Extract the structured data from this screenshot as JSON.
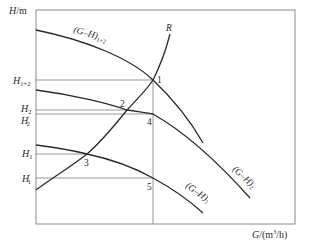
{
  "diagram": {
    "type": "pump-curve",
    "y_axis_label": {
      "var": "H",
      "unit": "m"
    },
    "x_axis_label": {
      "var": "G",
      "unit": "(m",
      "sup": "3",
      "tail": "/h)"
    },
    "h_levels": [
      {
        "id": "H1+2",
        "main": "H",
        "sub": "1+2",
        "prime": ""
      },
      {
        "id": "H2",
        "main": "H",
        "sub": "2",
        "prime": ""
      },
      {
        "id": "H2p",
        "main": "H",
        "sub": "2",
        "prime": "′"
      },
      {
        "id": "H1",
        "main": "H",
        "sub": "1",
        "prime": ""
      },
      {
        "id": "H1p",
        "main": "H",
        "sub": "1",
        "prime": "′"
      }
    ],
    "curves": [
      {
        "id": "GH12",
        "label": "(G–H)",
        "sub": "1+2"
      },
      {
        "id": "GH2",
        "label": "(G–H)",
        "sub": "2"
      },
      {
        "id": "GH1",
        "label": "(G–H)",
        "sub": "1"
      },
      {
        "id": "R",
        "label": "R",
        "sub": ""
      }
    ],
    "points": [
      "1",
      "2",
      "3",
      "4",
      "5"
    ],
    "colors": {
      "curve": "#2a2a2a",
      "guide": "#8a8a8a",
      "frame": "#8a8a8a"
    }
  }
}
